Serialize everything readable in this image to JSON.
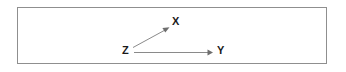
{
  "figure": {
    "type": "directed-graph",
    "background_color": "#ffffff",
    "border_color": "#8f8f8f",
    "edge_color": "#8a8a8a",
    "arrowhead_color": "#6e6e6e",
    "label_color": "#1a1a1a"
  },
  "nodes": [
    {
      "id": "Z",
      "label": "Z",
      "x": 126,
      "y": 51
    },
    {
      "id": "X",
      "label": "X",
      "x": 176,
      "y": 22
    },
    {
      "id": "Y",
      "label": "Y",
      "x": 221,
      "y": 51
    }
  ],
  "edges": [
    {
      "id": "z-to-x",
      "from": "Z",
      "to": "X",
      "directed": true,
      "label": "",
      "start_x": 133,
      "start_y": 47,
      "end_x": 168,
      "end_y": 28
    },
    {
      "id": "z-to-y",
      "from": "Z",
      "to": "Y",
      "directed": true,
      "label": "",
      "start_x": 134,
      "start_y": 52,
      "end_x": 212,
      "end_y": 52
    }
  ]
}
